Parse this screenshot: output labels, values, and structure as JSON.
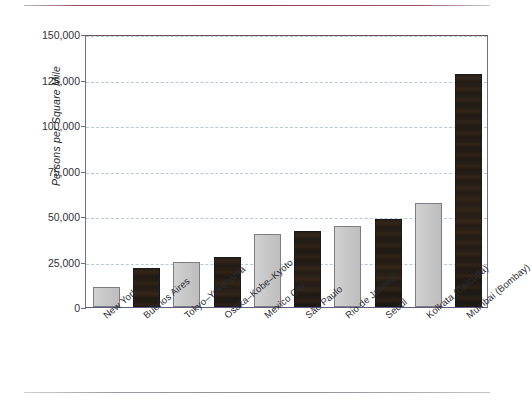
{
  "page": {
    "top_rule_color": "#8d3d50",
    "bottom_rule_color": "#8e8e99",
    "background": "#ffffff"
  },
  "chart_data": {
    "type": "bar",
    "title": "",
    "xlabel": "",
    "ylabel": "Persons per Square Mile",
    "ylim": [
      0,
      150000
    ],
    "grid": true,
    "legend": "none",
    "ytick_labels": [
      "0",
      "25,000",
      "50,000",
      "75,000",
      "100,000",
      "125,000",
      "150,000"
    ],
    "ytick_values": [
      0,
      25000,
      50000,
      75000,
      100000,
      125000,
      150000
    ],
    "categories": [
      "New York",
      "Buenos Aires",
      "Tokyo–Yokohama",
      "Osaka–Kobe–Kyoto",
      "Mexico City",
      "São Paulo",
      "Rio de Janeiro",
      "Seoul",
      "Kolkata (Calcutta)",
      "Mumbai (Bombay)"
    ],
    "values": [
      11000,
      21500,
      25000,
      27500,
      40000,
      41500,
      44500,
      48500,
      57000,
      128000
    ],
    "bar_styles": [
      "light",
      "dark",
      "light",
      "dark",
      "light",
      "dark",
      "light",
      "dark",
      "light",
      "dark"
    ],
    "colors": {
      "light_bar": "#c9c9c9",
      "dark_bar": "#241d16",
      "gridline": "#9fb8c4",
      "axis": "#6f6f86",
      "text": "#2b2b33"
    }
  }
}
